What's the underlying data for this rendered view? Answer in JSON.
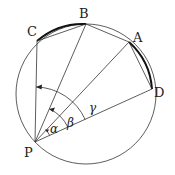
{
  "diagram": {
    "type": "geometry",
    "circle": {
      "cx": 86,
      "cy": 94,
      "r": 70
    },
    "points": {
      "P": {
        "x": 35,
        "y": 142,
        "label": "P"
      },
      "C": {
        "x": 37,
        "y": 41,
        "label": "C"
      },
      "B": {
        "x": 86,
        "y": 24,
        "label": "B"
      },
      "A": {
        "x": 129,
        "y": 42,
        "label": "A"
      },
      "D": {
        "x": 152,
        "y": 89,
        "label": "D"
      }
    },
    "angles": {
      "alpha": "α",
      "beta": "β",
      "gamma": "γ"
    },
    "colors": {
      "stroke": "#222222",
      "background": "#ffffff"
    }
  }
}
